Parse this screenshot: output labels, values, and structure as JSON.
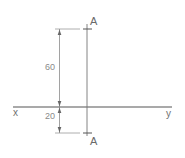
{
  "diagram": {
    "title": "",
    "point_labels": {
      "top": "A",
      "bottom": "A"
    },
    "axis_labels": {
      "left": "x",
      "right": "y"
    },
    "dimensions": {
      "upper": "60",
      "lower": "20"
    },
    "colors": {
      "line": "#555555",
      "thin_line": "#9a9a9a",
      "text": "#6a6a6a"
    }
  }
}
